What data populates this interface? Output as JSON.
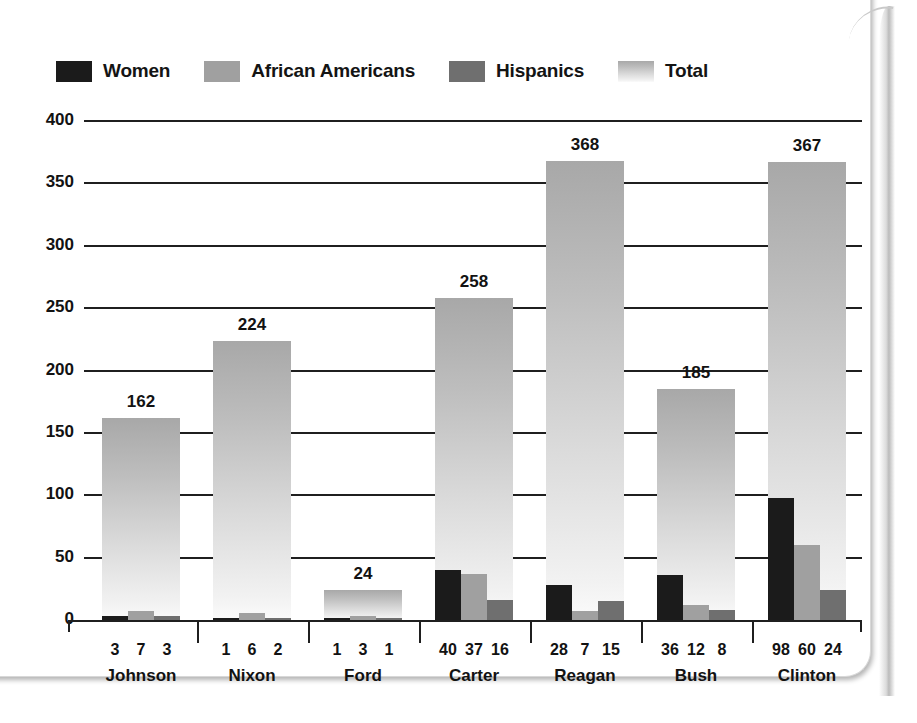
{
  "chart_data": {
    "type": "bar",
    "title": "",
    "xlabel": "",
    "ylabel": "",
    "ylim": [
      0,
      400
    ],
    "ytick_labels": [
      "400",
      "350",
      "300",
      "250",
      "200",
      "150",
      "100",
      "50",
      "0"
    ],
    "ytick_values": [
      400,
      350,
      300,
      250,
      200,
      150,
      100,
      50,
      0
    ],
    "grid": true,
    "legend_position": "top-left",
    "categories": [
      "Johnson",
      "Nixon",
      "Ford",
      "Carter",
      "Reagan",
      "Bush",
      "Clinton"
    ],
    "series": [
      {
        "name": "Women",
        "color": "#1b1b1b",
        "values": [
          3,
          1,
          1,
          40,
          28,
          36,
          98
        ]
      },
      {
        "name": "African Americans",
        "color": "#a0a0a0",
        "values": [
          7,
          6,
          3,
          37,
          7,
          12,
          60
        ]
      },
      {
        "name": "Hispanics",
        "color": "#6f6f6f",
        "values": [
          3,
          2,
          1,
          16,
          15,
          8,
          24
        ]
      },
      {
        "name": "Total",
        "color": "#cfcfcf",
        "values": [
          162,
          224,
          24,
          258,
          368,
          185,
          367
        ]
      }
    ],
    "total_labels": [
      "162",
      "224",
      "24",
      "258",
      "368",
      "185",
      "367"
    ],
    "sub_value_labels": [
      [
        "3",
        "7",
        "3"
      ],
      [
        "1",
        "6",
        "2"
      ],
      [
        "1",
        "3",
        "1"
      ],
      [
        "40",
        "37",
        "16"
      ],
      [
        "28",
        "7",
        "15"
      ],
      [
        "36",
        "12",
        "8"
      ],
      [
        "98",
        "60",
        "24"
      ]
    ]
  },
  "legend": {
    "items": [
      {
        "label": "Women",
        "swatch": "legend-swatch-women"
      },
      {
        "label": "African Americans",
        "swatch": "legend-swatch-african-americans"
      },
      {
        "label": "Hispanics",
        "swatch": "legend-swatch-hispanics"
      },
      {
        "label": "Total",
        "swatch": "legend-swatch-total"
      }
    ]
  },
  "ghost_marks": [
    {
      "text": ""
    }
  ]
}
